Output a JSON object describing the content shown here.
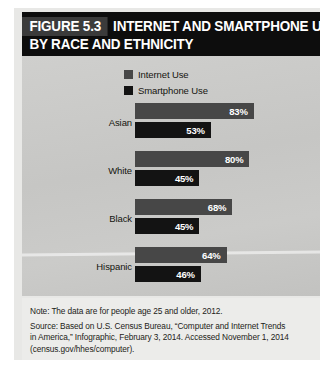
{
  "figure": {
    "number_label": "FIGURE 5.3",
    "title_line1": "INTERNET AND SMARTPHONE USE,",
    "title_line2": "BY RACE AND ETHNICITY"
  },
  "legend": {
    "position": "top-center",
    "items": [
      {
        "label": "Internet Use",
        "color": "#474747"
      },
      {
        "label": "Smartphone Use",
        "color": "#131313"
      }
    ]
  },
  "notes": {
    "note": "Note: The data are for people age 25 and older, 2012.",
    "source_line1": "Source: Based on U.S. Census Bureau, “Computer and Internet Trends",
    "source_line2": "in America,” Infographic, February 3, 2014. Accessed November 1, 2014",
    "source_line3": "(census.gov/hhes/computer)."
  },
  "chart_data": {
    "type": "bar",
    "orientation": "horizontal",
    "xlabel": "",
    "ylabel": "",
    "xlim": [
      0,
      100
    ],
    "grid": false,
    "legend_position": "top-center",
    "categories": [
      "Asian",
      "White",
      "Black",
      "Hispanic"
    ],
    "series": [
      {
        "name": "Internet Use",
        "color": "#474747",
        "values": [
          83,
          80,
          68,
          64
        ],
        "labels": [
          "83%",
          "80%",
          "68%",
          "64%"
        ]
      },
      {
        "name": "Smartphone Use",
        "color": "#131313",
        "values": [
          53,
          45,
          45,
          46
        ],
        "labels": [
          "53%",
          "45%",
          "45%",
          "46%"
        ]
      }
    ],
    "rows": [
      {
        "category": "Asian",
        "internet": 83,
        "internet_label": "83%",
        "smartphone": 53,
        "smartphone_label": "53%"
      },
      {
        "category": "White",
        "internet": 80,
        "internet_label": "80%",
        "smartphone": 45,
        "smartphone_label": "45%"
      },
      {
        "category": "Black",
        "internet": 68,
        "internet_label": "68%",
        "smartphone": 45,
        "smartphone_label": "45%"
      },
      {
        "category": "Hispanic",
        "internet": 64,
        "internet_label": "64%",
        "smartphone": 46,
        "smartphone_label": "46%"
      }
    ]
  }
}
